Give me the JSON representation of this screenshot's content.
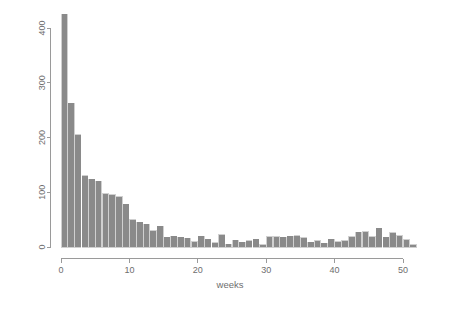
{
  "chart_data": {
    "type": "bar",
    "title": "",
    "subtitle": "",
    "xlabel": "weeks",
    "ylabel": "",
    "xlim": [
      0,
      52
    ],
    "ylim": [
      0,
      430
    ],
    "grid": false,
    "legend": null,
    "bar_color": "#8a8a8a",
    "bar_edge_color": "#8a8a8a",
    "axis_color": "#9a9a9a",
    "label_color": "#6e6e6e",
    "background": "#ffffff",
    "x_ticks": [
      0,
      10,
      20,
      30,
      40,
      50
    ],
    "x_tick_labels": [
      "0",
      "10",
      "20",
      "30",
      "40",
      "50"
    ],
    "y_ticks": [
      0,
      100,
      200,
      300,
      400
    ],
    "y_tick_labels": [
      "0",
      "100",
      "200",
      "300",
      "400"
    ],
    "categories": [
      1,
      2,
      3,
      4,
      5,
      6,
      7,
      8,
      9,
      10,
      11,
      12,
      13,
      14,
      15,
      16,
      17,
      18,
      19,
      20,
      21,
      22,
      23,
      24,
      25,
      26,
      27,
      28,
      29,
      30,
      31,
      32,
      33,
      34,
      35,
      36,
      37,
      38,
      39,
      40,
      41,
      42,
      43,
      44,
      45,
      46,
      47,
      48,
      49,
      50,
      51,
      52
    ],
    "values": [
      425,
      263,
      205,
      130,
      124,
      120,
      97,
      95,
      92,
      78,
      50,
      45,
      42,
      30,
      38,
      18,
      20,
      18,
      16,
      10,
      20,
      14,
      8,
      22,
      5,
      12,
      9,
      11,
      14,
      4,
      19,
      19,
      18,
      20,
      21,
      17,
      9,
      11,
      7,
      14,
      10,
      11,
      19,
      27,
      28,
      19,
      34,
      18,
      26,
      21,
      13,
      4
    ]
  },
  "axis_titles": {
    "x": "weeks"
  }
}
